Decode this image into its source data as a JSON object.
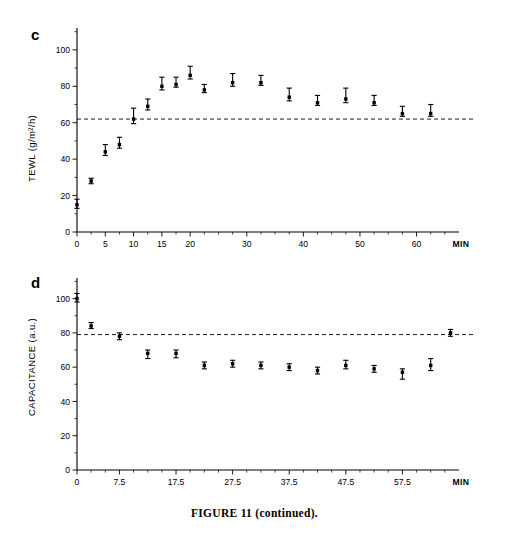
{
  "figure": {
    "caption": "FIGURE 11 (continued).",
    "background_color": "#ffffff",
    "ink_color": "#000000"
  },
  "panels": [
    {
      "id": "c",
      "letter": "c",
      "ylabel": "TEWL (g/m²/h)",
      "xunit_label": "MIN"
    },
    {
      "id": "d",
      "letter": "d",
      "ylabel": "CAPACITANCE (a.u.)",
      "xunit_label": "MIN"
    }
  ],
  "chart_data": [
    {
      "type": "scatter",
      "panel": "c",
      "title": "",
      "xlabel": "MIN",
      "ylabel": "TEWL (g/m²/h)",
      "xlim": [
        0,
        67.5
      ],
      "ylim": [
        0,
        112
      ],
      "xticks": [
        0,
        5,
        10,
        15,
        20,
        30,
        40,
        50,
        60
      ],
      "xtick_labels": [
        "0",
        "5",
        "10",
        "15",
        "20",
        "30",
        "40",
        "50",
        "60"
      ],
      "xminor_ticks": [
        2.5,
        7.5,
        12.5,
        17.5,
        22.5,
        25,
        27.5,
        32.5,
        35,
        37.5,
        42.5,
        45,
        47.5,
        52.5,
        55,
        57.5,
        62.5,
        65
      ],
      "yticks": [
        0,
        20,
        40,
        60,
        80,
        100
      ],
      "ytick_labels": [
        "0",
        "20",
        "40",
        "60",
        "80",
        "100"
      ],
      "yminor_ticks": [
        10,
        30,
        50,
        70,
        90,
        110
      ],
      "grid": false,
      "legend": "none",
      "reference_line": {
        "y": 62,
        "style": "dashed",
        "label": ""
      },
      "series": [
        {
          "name": "TEWL",
          "marker": "filled-square-with-error-bar",
          "x": [
            0,
            2.5,
            5,
            7.5,
            10,
            12.5,
            15,
            17.5,
            20,
            22.5,
            27.5,
            32.5,
            37.5,
            42.5,
            47.5,
            52.5,
            57.5,
            62.5
          ],
          "y": [
            15,
            28,
            44,
            48,
            62,
            69,
            80,
            81,
            86,
            78,
            82,
            82,
            74,
            71,
            73,
            71,
            65,
            65
          ],
          "err_low": [
            2,
            1.5,
            2,
            2,
            2.5,
            2,
            2,
            1.5,
            2,
            1.5,
            2,
            1.5,
            2,
            1.5,
            2,
            1.5,
            1.5,
            1.5
          ],
          "err_high": [
            3,
            1.5,
            4,
            4,
            6,
            4,
            5,
            4,
            5,
            3,
            5,
            4,
            5,
            4,
            6,
            4,
            4,
            5
          ]
        }
      ]
    },
    {
      "type": "scatter",
      "panel": "d",
      "title": "",
      "xlabel": "MIN",
      "ylabel": "CAPACITANCE (a.u.)",
      "xlim": [
        0,
        67.5
      ],
      "ylim": [
        0,
        112
      ],
      "xticks": [
        0,
        7.5,
        17.5,
        27.5,
        37.5,
        47.5,
        57.5
      ],
      "xtick_labels": [
        "0",
        "7.5",
        "17.5",
        "27.5",
        "37.5",
        "47.5",
        "57.5"
      ],
      "xminor_ticks": [
        2.5,
        5,
        10,
        12.5,
        15,
        20,
        22.5,
        25,
        30,
        32.5,
        35,
        40,
        42.5,
        45,
        50,
        52.5,
        55,
        60,
        62.5,
        65
      ],
      "yticks": [
        0,
        20,
        40,
        60,
        80,
        100
      ],
      "ytick_labels": [
        "0",
        "20",
        "40",
        "60",
        "80",
        "100"
      ],
      "yminor_ticks": [
        10,
        30,
        50,
        70,
        90,
        110
      ],
      "grid": false,
      "legend": "none",
      "reference_line": {
        "y": 79,
        "style": "dashed",
        "label": ""
      },
      "series": [
        {
          "name": "Capacitance",
          "marker": "filled-square-with-error-bar",
          "x": [
            0,
            2.5,
            7.5,
            12.5,
            17.5,
            22.5,
            27.5,
            32.5,
            37.5,
            42.5,
            47.5,
            52.5,
            57.5,
            62.5,
            66
          ],
          "y": [
            100,
            84,
            78,
            68,
            68,
            61,
            62,
            61,
            60,
            58,
            61,
            59,
            57,
            61,
            80
          ],
          "err_low": [
            2,
            1.5,
            2,
            3,
            2.5,
            2,
            2,
            2,
            2,
            2,
            2,
            2,
            4,
            3,
            2
          ],
          "err_high": [
            3,
            2,
            2,
            2,
            2,
            2,
            2,
            2,
            2,
            2,
            3,
            2,
            2,
            4,
            2
          ]
        }
      ]
    }
  ]
}
